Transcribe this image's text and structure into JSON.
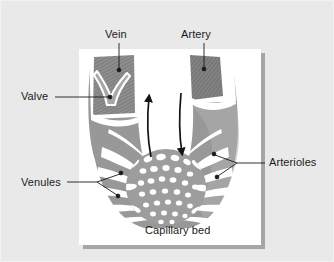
{
  "figure": {
    "title_alt": "Capillary bed circulation diagram",
    "background_color": "#e9e9e9",
    "panel_color": "#ffffff",
    "shadow_color": "#6f6f6f",
    "vessel_fill": "#989898",
    "vessel_dark_fill": "#7c7c7c",
    "vessel_light_fill": "#b4b4b4",
    "outline_color": "#ffffff",
    "ink_color": "#1a1a1a",
    "labels": {
      "vein": "Vein",
      "artery": "Artery",
      "valve": "Valve",
      "venules": "Venules",
      "arterioles": "Arterioles",
      "capillary_bed": "Capillary bed"
    },
    "flow_arrows": [
      {
        "name": "vein-flow-arrow",
        "direction": "up",
        "side": "left"
      },
      {
        "name": "artery-flow-arrow",
        "direction": "down",
        "side": "right"
      }
    ],
    "icons": {
      "vein_leader": "leader-line-icon",
      "artery_leader": "leader-line-icon",
      "valve_leader": "leader-line-icon",
      "venules_leader": "forked-leader-line-icon",
      "arterioles_leader": "forked-leader-line-icon"
    }
  }
}
